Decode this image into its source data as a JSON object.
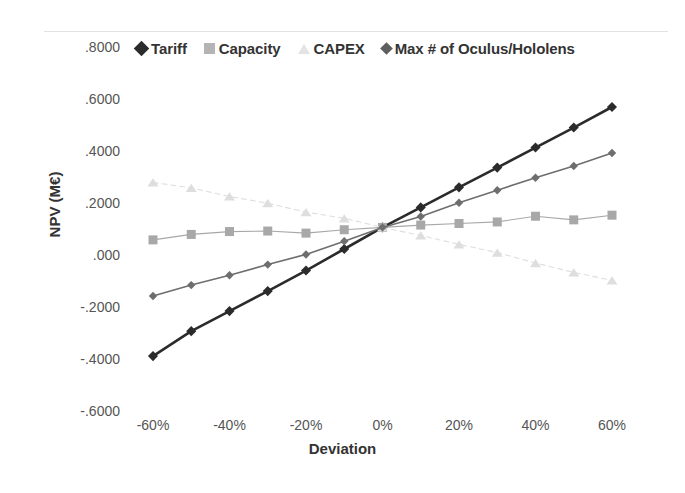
{
  "chart_data": {
    "type": "line",
    "title": "",
    "xlabel": "Deviation",
    "ylabel": "NPV (M€)",
    "x": [
      -60,
      -50,
      -40,
      -30,
      -20,
      -10,
      0,
      10,
      20,
      30,
      40,
      50,
      60
    ],
    "x_tick_labels": [
      "-60%",
      "-40%",
      "-20%",
      "0%",
      "20%",
      "40%",
      "60%"
    ],
    "x_tick_values": [
      -60,
      -40,
      -20,
      0,
      20,
      40,
      60
    ],
    "xlim": [
      -65,
      65
    ],
    "y_tick_labels": [
      ".8000",
      ".6000",
      ".4000",
      ".2000",
      ".000",
      "-.2000",
      "-.4000",
      "-.6000"
    ],
    "y_tick_values": [
      0.8,
      0.6,
      0.4,
      0.2,
      0.0,
      -0.2,
      -0.4,
      -0.6
    ],
    "ylim": [
      -0.6,
      0.8
    ],
    "grid": false,
    "legend_position": "top",
    "series": [
      {
        "name": "Tariff",
        "marker": "diamond",
        "color": "#2b2b2b",
        "line_width": 2.6,
        "marker_size": 9,
        "dashed": false,
        "values": [
          -0.385,
          -0.289,
          -0.212,
          -0.135,
          -0.056,
          0.027,
          0.11,
          0.187,
          0.264,
          0.34,
          0.417,
          0.494,
          0.573
        ]
      },
      {
        "name": "Capacity",
        "marker": "square",
        "color": "#a8a8a8",
        "line_width": 1.1,
        "marker_size": 9,
        "dashed": false,
        "values": [
          0.062,
          0.083,
          0.094,
          0.096,
          0.088,
          0.101,
          0.11,
          0.119,
          0.125,
          0.131,
          0.153,
          0.139,
          0.157
        ]
      },
      {
        "name": "CAPEX",
        "marker": "triangle",
        "color": "#dedede",
        "line_width": 1.1,
        "marker_size": 9,
        "dashed": true,
        "values": [
          0.283,
          0.262,
          0.229,
          0.203,
          0.169,
          0.145,
          0.11,
          0.079,
          0.045,
          0.013,
          -0.027,
          -0.063,
          -0.094
        ]
      },
      {
        "name": "Max # of Oculus/Hololens",
        "marker": "diamond-small",
        "color": "#6e6e6e",
        "line_width": 1.6,
        "marker_size": 8,
        "dashed": false,
        "values": [
          -0.154,
          -0.112,
          -0.074,
          -0.033,
          0.006,
          0.057,
          0.11,
          0.152,
          0.205,
          0.253,
          0.301,
          0.346,
          0.396
        ]
      }
    ]
  },
  "legend": {
    "items": [
      {
        "label": "Tariff"
      },
      {
        "label": "Capacity"
      },
      {
        "label": "CAPEX"
      },
      {
        "label": "Max # of Oculus/Hololens"
      }
    ]
  }
}
